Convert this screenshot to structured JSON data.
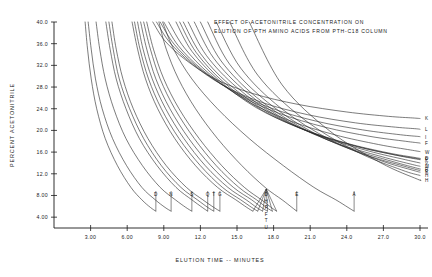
{
  "chart_data": {
    "type": "line",
    "title_line1": "EFFECT OF ACETONITRILE CONCENTRATION ON",
    "title_line2": "ELUTION OF PTH AMINO ACIDS FROM PTH-C18 COLUMN",
    "xlabel": "ELUTION TIME -- MINUTES",
    "ylabel": "PERCENT ACETONITRILE",
    "xlim": [
      0.0,
      30.0
    ],
    "ylim": [
      2.0,
      40.0
    ],
    "grid": false,
    "legend": "none",
    "xticks": [
      3.0,
      6.0,
      9.0,
      12.0,
      15.0,
      18.0,
      21.0,
      24.0,
      27.0,
      30.0
    ],
    "xtick_labels": [
      "3.00",
      "6.00",
      "9.00",
      "12.0",
      "15.0",
      "18.0",
      "21.0",
      "24.0",
      "27.0",
      "30.0"
    ],
    "yticks": [
      4.0,
      8.0,
      12.0,
      16.0,
      20.0,
      24.0,
      28.0,
      32.0,
      36.0,
      40.0
    ],
    "ytick_labels": [
      "4.00",
      "8.00",
      "12.0",
      "16.0",
      "20.0",
      "24.0",
      "28.0",
      "32.0",
      "36.0",
      "40.0"
    ],
    "series": [
      {
        "name": "D",
        "label": "D",
        "label_pos": "bottom",
        "x": [
          2.55,
          2.75,
          3.05,
          3.5,
          4.2,
          5.2,
          6.3,
          7.2,
          7.9,
          8.35
        ],
        "y": [
          40.0,
          35.0,
          29.5,
          24.0,
          18.5,
          13.5,
          9.5,
          7.2,
          5.8,
          5.1
        ]
      },
      {
        "name": "N",
        "label": "N",
        "label_pos": "bottom",
        "x": [
          2.8,
          3.05,
          3.4,
          3.95,
          4.8,
          5.95,
          7.2,
          8.3,
          9.1,
          9.6
        ],
        "y": [
          40.0,
          35.0,
          29.5,
          24.0,
          18.5,
          13.5,
          9.5,
          7.2,
          5.8,
          5.1
        ]
      },
      {
        "name": "S",
        "label": "S",
        "label_pos": "bottom",
        "x": [
          3.45,
          3.75,
          4.2,
          4.9,
          5.9,
          7.25,
          8.7,
          9.95,
          10.8,
          11.3
        ],
        "y": [
          40.0,
          35.0,
          29.5,
          24.0,
          18.5,
          13.5,
          9.5,
          7.2,
          5.8,
          5.1
        ]
      },
      {
        "name": "Q",
        "label": "Q",
        "label_pos": "bottom",
        "x": [
          4.25,
          4.6,
          5.1,
          5.9,
          7.0,
          8.45,
          10.0,
          11.3,
          12.15,
          12.6
        ],
        "y": [
          40.0,
          35.0,
          29.5,
          24.0,
          18.5,
          13.5,
          9.5,
          7.2,
          5.8,
          5.1
        ]
      },
      {
        "name": "T",
        "label": "T",
        "label_pos": "bottom",
        "x": [
          4.5,
          4.85,
          5.35,
          6.2,
          7.35,
          8.8,
          10.4,
          11.75,
          12.6,
          13.1
        ],
        "y": [
          40.0,
          35.0,
          29.5,
          24.0,
          18.5,
          13.5,
          9.5,
          7.2,
          5.8,
          5.1
        ]
      },
      {
        "name": "G",
        "label": "G",
        "label_pos": "bottom",
        "x": [
          4.75,
          5.1,
          5.65,
          6.5,
          7.7,
          9.2,
          10.85,
          12.2,
          13.1,
          13.6
        ],
        "y": [
          40.0,
          35.0,
          29.5,
          24.0,
          18.5,
          13.5,
          9.5,
          7.2,
          5.8,
          5.1
        ]
      },
      {
        "name": "D2",
        "label": "D",
        "label_pos": "bottom-stack",
        "x": [
          6.4,
          6.85,
          7.5,
          8.5,
          9.9,
          11.6,
          13.4,
          14.9,
          15.8,
          16.3
        ],
        "y": [
          40.0,
          35.0,
          29.5,
          24.0,
          18.5,
          13.5,
          9.5,
          7.2,
          5.8,
          5.1
        ]
      },
      {
        "name": "H",
        "label": "H",
        "label_pos": "bottom-stack",
        "x": [
          6.6,
          7.05,
          7.75,
          8.8,
          10.25,
          12.0,
          13.8,
          15.3,
          16.2,
          16.7
        ],
        "y": [
          40.0,
          35.0,
          29.5,
          24.0,
          18.5,
          13.5,
          9.5,
          7.2,
          5.8,
          5.1
        ]
      },
      {
        "name": "P",
        "label": "P",
        "label_pos": "bottom-stack",
        "x": [
          6.85,
          7.3,
          8.05,
          9.15,
          10.65,
          12.4,
          14.25,
          15.75,
          16.6,
          17.1
        ],
        "y": [
          40.0,
          35.0,
          29.5,
          24.0,
          18.5,
          13.5,
          9.5,
          7.2,
          5.8,
          5.1
        ]
      },
      {
        "name": "F",
        "label": "F",
        "label_pos": "bottom-stack",
        "x": [
          7.1,
          7.6,
          8.35,
          9.5,
          11.05,
          12.85,
          14.7,
          16.2,
          17.0,
          17.5
        ],
        "y": [
          40.0,
          35.0,
          29.5,
          24.0,
          18.5,
          13.5,
          9.5,
          7.2,
          5.8,
          5.1
        ]
      },
      {
        "name": "T2",
        "label": "T",
        "label_pos": "bottom-stack",
        "x": [
          7.35,
          7.9,
          8.7,
          9.9,
          11.5,
          13.3,
          15.15,
          16.6,
          17.4,
          17.9
        ],
        "y": [
          40.0,
          35.0,
          29.5,
          24.0,
          18.5,
          13.5,
          9.5,
          7.2,
          5.8,
          5.1
        ]
      },
      {
        "name": "U",
        "label": "U",
        "label_pos": "bottom-stack",
        "x": [
          7.6,
          8.15,
          9.0,
          10.25,
          11.9,
          13.75,
          15.6,
          17.0,
          17.8,
          18.25
        ],
        "y": [
          40.0,
          35.0,
          29.5,
          24.0,
          18.5,
          13.5,
          9.5,
          7.2,
          5.8,
          5.1
        ]
      },
      {
        "name": "E",
        "label": "E",
        "label_pos": "bottom",
        "x": [
          8.6,
          9.2,
          10.2,
          11.6,
          13.4,
          15.4,
          17.3,
          18.7,
          19.5,
          19.9
        ],
        "y": [
          40.0,
          35.0,
          29.5,
          24.0,
          18.5,
          13.5,
          9.5,
          7.2,
          5.8,
          5.1
        ]
      },
      {
        "name": "A",
        "label": "A",
        "label_pos": "bottom-right",
        "x": [
          8.9,
          9.8,
          11.3,
          13.4,
          16.0,
          18.8,
          21.3,
          23.1,
          24.1,
          24.6
        ],
        "y": [
          40.0,
          35.0,
          29.5,
          24.0,
          18.5,
          13.5,
          9.5,
          7.2,
          5.8,
          5.1
        ]
      },
      {
        "name": "K",
        "label": "K",
        "label_pos": "right",
        "x": [
          8.1,
          9.1,
          10.8,
          13.2,
          16.3,
          20.0,
          24.0,
          27.4,
          29.4,
          30.0
        ],
        "y": [
          40.0,
          36.5,
          33.0,
          29.5,
          26.8,
          24.8,
          23.4,
          22.6,
          22.3,
          22.2
        ]
      },
      {
        "name": "L",
        "label": "L",
        "label_pos": "right",
        "x": [
          8.4,
          9.5,
          11.3,
          13.8,
          17.0,
          20.8,
          24.7,
          28.0,
          29.7,
          30.0
        ],
        "y": [
          40.0,
          36.2,
          32.3,
          28.4,
          25.2,
          22.9,
          21.4,
          20.6,
          20.3,
          20.2
        ]
      },
      {
        "name": "I",
        "label": "I",
        "label_pos": "right",
        "x": [
          8.7,
          9.85,
          11.75,
          14.4,
          17.7,
          21.5,
          25.3,
          28.4,
          29.8,
          30.0
        ],
        "y": [
          40.0,
          35.9,
          31.7,
          27.6,
          24.2,
          21.7,
          20.1,
          19.2,
          18.9,
          18.85
        ]
      },
      {
        "name": "F2",
        "label": "F",
        "label_pos": "right",
        "x": [
          9.0,
          10.2,
          12.2,
          15.0,
          18.4,
          22.2,
          25.9,
          28.8,
          29.9,
          30.0
        ],
        "y": [
          40.0,
          35.6,
          31.1,
          26.7,
          23.2,
          20.6,
          18.9,
          18.0,
          17.7,
          17.65
        ]
      },
      {
        "name": "W",
        "label": "W",
        "label_pos": "right",
        "x": [
          9.4,
          10.7,
          12.8,
          15.7,
          19.2,
          23.0,
          26.6,
          29.2,
          30.0
        ],
        "y": [
          40.0,
          35.2,
          30.3,
          25.6,
          21.9,
          19.2,
          17.4,
          16.4,
          16.1
        ]
      },
      {
        "name": "D3",
        "label": "D",
        "label_pos": "right-cluster",
        "x": [
          10.0,
          11.3,
          13.5,
          16.5,
          20.1,
          23.9,
          27.3,
          29.6,
          30.0
        ],
        "y": [
          40.0,
          34.6,
          29.3,
          24.3,
          20.5,
          17.7,
          15.9,
          15.0,
          14.85
        ]
      },
      {
        "name": "R0",
        "label": "F",
        "label_pos": "right-cluster",
        "x": [
          10.3,
          11.65,
          13.9,
          17.0,
          20.6,
          24.4,
          27.7,
          29.8,
          30.0
        ],
        "y": [
          40.0,
          34.4,
          28.9,
          23.8,
          20.0,
          17.3,
          15.6,
          14.8,
          14.75
        ]
      },
      {
        "name": "Y0",
        "label": "Y",
        "label_pos": "right-cluster",
        "x": [
          10.6,
          12.0,
          14.3,
          17.5,
          21.1,
          24.9,
          28.1,
          30.0
        ],
        "y": [
          40.0,
          34.2,
          28.6,
          23.4,
          19.6,
          17.0,
          15.4,
          14.6
        ]
      },
      {
        "name": "V",
        "label": "V",
        "label_pos": "right",
        "x": [
          11.0,
          12.5,
          15.0,
          18.3,
          22.0,
          25.8,
          28.8,
          30.0
        ],
        "y": [
          40.0,
          33.8,
          27.9,
          22.6,
          18.8,
          16.2,
          14.6,
          14.0
        ]
      },
      {
        "name": "M",
        "label": "M",
        "label_pos": "right",
        "x": [
          11.5,
          13.1,
          15.8,
          19.3,
          23.1,
          26.8,
          29.4,
          30.0
        ],
        "y": [
          40.0,
          33.3,
          27.0,
          21.5,
          17.7,
          15.2,
          13.7,
          13.4
        ]
      },
      {
        "name": "P2",
        "label": "P",
        "label_pos": "right",
        "x": [
          12.0,
          13.7,
          16.6,
          20.3,
          24.2,
          27.7,
          29.8,
          30.0
        ],
        "y": [
          40.0,
          32.8,
          26.1,
          20.5,
          16.7,
          14.3,
          13.0,
          12.9
        ]
      },
      {
        "name": "R",
        "label": "R",
        "label_pos": "right",
        "x": [
          12.6,
          14.4,
          17.5,
          21.4,
          25.4,
          28.7,
          30.0
        ],
        "y": [
          40.0,
          32.2,
          25.2,
          19.4,
          15.6,
          13.4,
          12.6
        ]
      },
      {
        "name": "Y",
        "label": "Y",
        "label_pos": "right",
        "x": [
          13.3,
          15.3,
          18.6,
          22.7,
          26.7,
          29.5,
          30.0
        ],
        "y": [
          40.0,
          31.5,
          24.1,
          18.2,
          14.5,
          12.6,
          12.3
        ]
      },
      {
        "name": "H2",
        "label": "H",
        "label_pos": "right",
        "x": [
          14.4,
          16.7,
          20.4,
          24.7,
          28.5,
          30.0
        ],
        "y": [
          40.0,
          30.2,
          22.2,
          16.2,
          12.7,
          11.7
        ]
      },
      {
        "name": "Hlow",
        "label": "H",
        "label_pos": "right-low",
        "x": [
          16.0,
          18.7,
          22.6,
          26.8,
          29.8,
          30.0
        ],
        "y": [
          40.0,
          28.4,
          19.9,
          14.0,
          11.0,
          10.9
        ]
      }
    ],
    "bottom_labels": [
      {
        "text": "D",
        "x": 8.35
      },
      {
        "text": "N",
        "x": 9.6
      },
      {
        "text": "S",
        "x": 11.3
      },
      {
        "text": "Q",
        "x": 12.6
      },
      {
        "text": "T",
        "x": 13.1
      },
      {
        "text": "G",
        "x": 13.6
      },
      {
        "text": "E",
        "x": 19.9
      },
      {
        "text": "A",
        "x": 24.6
      }
    ],
    "bottom_stack_labels": [
      "D",
      "H",
      "P",
      "F",
      "T",
      "U"
    ],
    "right_labels": [
      "K",
      "L",
      "I",
      "F",
      "W",
      "D",
      "F",
      "Y",
      "V",
      "M",
      "P",
      "R",
      "Y",
      "H",
      "H"
    ]
  },
  "colors": {
    "background": "#ffffff",
    "ink": "#1a1a1a",
    "curve": "#2b2b2b"
  }
}
